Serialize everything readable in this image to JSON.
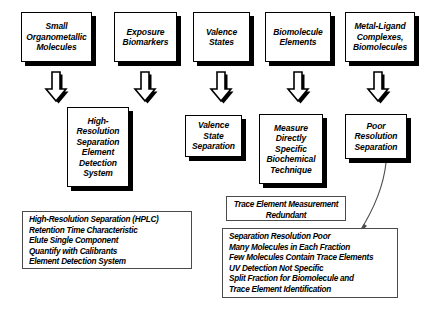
{
  "diagram": {
    "background_color": "#ffffff",
    "line_color": "#000000"
  },
  "top_nodes": [
    {
      "id": "small-organometallic-molecules",
      "text": "Small\nOrganometallic\nMolecules"
    },
    {
      "id": "exposure-biomarkers",
      "text": "Exposure\nBiomarkers"
    },
    {
      "id": "valence-states",
      "text": "Valence\nStates"
    },
    {
      "id": "biomolecule-elements",
      "text": "Biomolecule\nElements"
    },
    {
      "id": "metal-ligand-complexes",
      "text": "Metal-Ligand\nComplexes,\nBiomolecules"
    }
  ],
  "arrows": [
    {
      "id": "arrow-small-organometallic",
      "direction": "down"
    },
    {
      "id": "arrow-exposure-biomarkers",
      "direction": "down"
    },
    {
      "id": "arrow-valence-states",
      "direction": "down"
    },
    {
      "id": "arrow-biomolecule-elements",
      "direction": "down"
    },
    {
      "id": "arrow-metal-ligand-complexes",
      "direction": "down"
    }
  ],
  "bottom_nodes": [
    {
      "id": "high-resolution-separation-system",
      "text": "High-\nResolution\nSeparation\nElement\nDetection\nSystem"
    },
    {
      "id": "valence-state-separation",
      "text": "Valence\nState\nSeparation"
    },
    {
      "id": "measure-directly-specific-biochemical-technique",
      "text": "Measure\nDirectly\nSpecific\nBiochemical\nTechnique"
    },
    {
      "id": "poor-resolution-separation",
      "text": "Poor\nResolution\nSeparation"
    }
  ],
  "notes": {
    "hplc": {
      "id": "hplc-note",
      "lines": [
        "High-Resolution Separation (HPLC)",
        "Retention Time Characteristic",
        "Elute Single Component",
        "Quantify with Calibrants",
        "Element Detection System"
      ]
    },
    "redundant": {
      "id": "trace-element-redundant-note",
      "lines": [
        "Trace Element Measurement",
        "Redundant"
      ]
    },
    "poor_resolution": {
      "id": "poor-resolution-note",
      "lines": [
        "Separation Resolution Poor",
        "Many Molecules in Each Fraction",
        "Few Molecules Contain Trace Elements",
        "UV Detection Not Specific",
        "Split Fraction for Biomolecule and",
        "Trace Element Identification"
      ]
    }
  }
}
